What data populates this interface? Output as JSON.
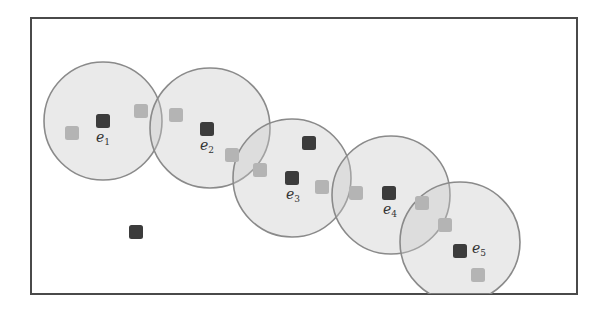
{
  "figure": {
    "frame": {
      "x": 31,
      "y": 18,
      "width": 546,
      "height": 276
    },
    "colors": {
      "circle_fill": "#d6d6d6",
      "circle_stroke": "#8a8a8a",
      "dark_square": "#3c3c3c",
      "light_square": "#b4b4b4",
      "frame": "#4a4a4a"
    },
    "clusters": [
      {
        "id": "e1",
        "label": "e",
        "subscript": "1",
        "center": [
          103,
          121
        ],
        "radius": 59,
        "label_pos": [
          96,
          142
        ]
      },
      {
        "id": "e2",
        "label": "e",
        "subscript": "2",
        "center": [
          210,
          128
        ],
        "radius": 60,
        "label_pos": [
          200,
          150
        ]
      },
      {
        "id": "e3",
        "label": "e",
        "subscript": "3",
        "center": [
          292,
          178
        ],
        "radius": 59,
        "label_pos": [
          286,
          199
        ]
      },
      {
        "id": "e4",
        "label": "e",
        "subscript": "4",
        "center": [
          391,
          195
        ],
        "radius": 59,
        "label_pos": [
          383,
          214
        ]
      },
      {
        "id": "e5",
        "label": "e",
        "subscript": "5",
        "center": [
          460,
          242
        ],
        "radius": 60,
        "label_pos": [
          472,
          253
        ]
      }
    ],
    "dark_points": [
      [
        103,
        121
      ],
      [
        207,
        129
      ],
      [
        292,
        178
      ],
      [
        389,
        193
      ],
      [
        460,
        251
      ],
      [
        309,
        143
      ],
      [
        136,
        232
      ]
    ],
    "light_points": [
      [
        72,
        133
      ],
      [
        141,
        111
      ],
      [
        176,
        115
      ],
      [
        232,
        155
      ],
      [
        260,
        170
      ],
      [
        322,
        187
      ],
      [
        356,
        193
      ],
      [
        422,
        203
      ],
      [
        445,
        225
      ],
      [
        478,
        275
      ]
    ]
  }
}
